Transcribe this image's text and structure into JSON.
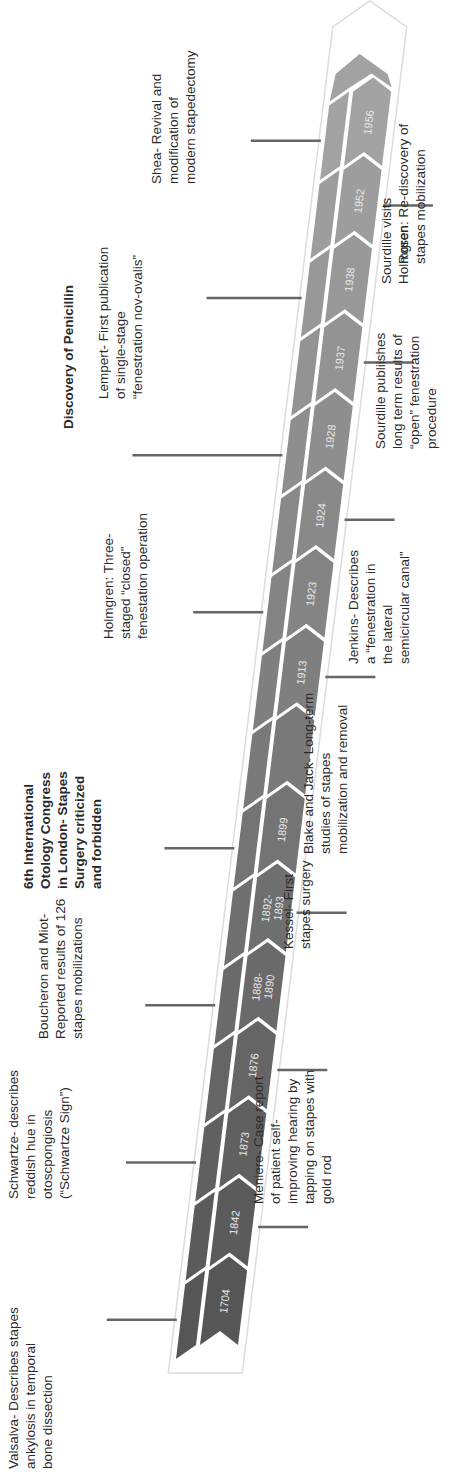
{
  "chart_data": {
    "type": "timeline",
    "title": "",
    "band_colors": {
      "start": "#5a5a5a",
      "end": "#9c9c9c",
      "divider": "#ffffff",
      "outline": "#e6e6e6"
    },
    "years": [
      "1704",
      "1842",
      "1873",
      "1876",
      "1888-\n1890",
      "1892-\n1893",
      "1899",
      "",
      "1913",
      "1923",
      "1924",
      "1928",
      "1937",
      "1938",
      "1952",
      "1956"
    ],
    "events_above": [
      {
        "year": "1704",
        "text": "Valsalva- Describes stapes\nankylosis in temporal\nbone dissection",
        "bold": false
      },
      {
        "year": "1873",
        "text": "Schwartze- describes\nreddish hue in\notoscpongiosis\n(“Schwartze Sign”)",
        "bold": false
      },
      {
        "year": "1888-1890",
        "text": "Boucheron and Miot-\nReported results of 126\nstapes mobilizations",
        "bold": false
      },
      {
        "year": "1899",
        "text": "6th International\nOtology Congress\nin London- Stapes\nSurgery criticized\nand forbidden",
        "bold": true
      },
      {
        "year": "1923",
        "text": "Holmgren: Three-\nstaged “closed”\nfenestation operation",
        "bold": false
      },
      {
        "year": "1928",
        "text": "Discovery of Penicillin",
        "bold": true
      },
      {
        "year": "1938",
        "text": "Lempert- First publication\nof single-stage\n“fenestration nov-ovalis”",
        "bold": false
      },
      {
        "year": "1956",
        "text": "Shea- Revival and\nmodification of\nmodern stapedectomy",
        "bold": false
      }
    ],
    "events_below": [
      {
        "year": "1842",
        "text": "Meniere- Case report\nof patient self-\nimproving hearing by\ntapping on stapes with\ngold rod"
      },
      {
        "year": "1876",
        "text": "Kessel- First\nstapes surgery"
      },
      {
        "year": "1892-1893",
        "text": "Blake and Jack- Long-term\nstudies of stapes\nmobilization and removal"
      },
      {
        "year": "1913",
        "text": "Jenkins- Describes\na “fenestration in\nthe lateral\nsemicircular canal”"
      },
      {
        "year": "1924",
        "text": "Sourdille visits\nHolmgren"
      },
      {
        "year": "1937",
        "text": "Sourdille publiishes\nlong term results of\n“open” fenestration\nprocedure"
      },
      {
        "year": "1952",
        "text": "Rosen: Re-discovery of\nstapes mobilization"
      }
    ]
  }
}
